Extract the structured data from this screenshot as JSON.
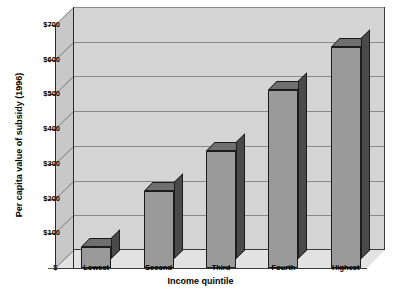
{
  "chart_data": {
    "type": "bar",
    "title": "",
    "subtitle": "",
    "xlabel": "Income quintile",
    "ylabel": "Per capita value of subsidy (1996)",
    "categories": [
      "Lowest",
      "Second",
      "Third",
      "Fourth",
      "Highest"
    ],
    "values": [
      60,
      222,
      338,
      513,
      636
    ],
    "ylim": [
      0,
      700
    ],
    "ytick_values": [
      0,
      100,
      200,
      300,
      400,
      500,
      600,
      700
    ],
    "ytick_labels": [
      "$-",
      "$100",
      "$200",
      "$300",
      "$400",
      "$500",
      "$600",
      "$700"
    ],
    "grid": true,
    "legend": "none",
    "series": [
      {
        "name": "Per capita value of subsidy (1996)",
        "values": [
          60,
          222,
          338,
          513,
          636
        ]
      }
    ],
    "style": {
      "projection": "3d-column",
      "bar_face_color": "#9a9a9a",
      "bar_side_color": "#4a4a4a",
      "bar_top_color": "#6f6f6f",
      "bar_edge_color": "#1c1c1c",
      "back_wall_color": "#d4d4d4",
      "side_wall_color": "#c8c8c8",
      "floor_color": "#e2e2e2",
      "gridline_color": "#8a8a8a",
      "axis_color": "#2a2a2a",
      "text_color": "#000000",
      "background_color": "#ffffff"
    }
  }
}
